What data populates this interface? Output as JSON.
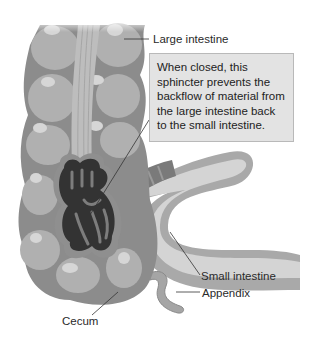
{
  "figure": {
    "labels": {
      "large_intestine": "Large intestine",
      "small_intestine": "Small intestine",
      "appendix": "Appendix",
      "cecum": "Cecum"
    },
    "callout": {
      "text": "When closed, this sphincter prevents the backflow of material from the large intestine back to the small intestine."
    },
    "colors": {
      "background": "#ffffff",
      "callout_fill": "#e3e3e3",
      "callout_border": "#b9b9b9",
      "colon_outer": "#8c8c8c",
      "colon_pouch": "#b0b0b0",
      "colon_highlight": "#d6d6d6",
      "lumen_dark": "#333333",
      "small_intestine_light": "#d4d4d4",
      "small_intestine_mid": "#a9a9a9",
      "leader_line": "#333333"
    }
  }
}
